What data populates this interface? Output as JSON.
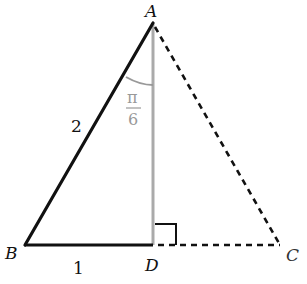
{
  "diagram": {
    "type": "triangle-geometry",
    "points": {
      "A": {
        "label": "A",
        "x": 153,
        "y": 23
      },
      "B": {
        "label": "B",
        "x": 25,
        "y": 245
      },
      "C": {
        "label": "C",
        "x": 280,
        "y": 245
      },
      "D": {
        "label": "D",
        "x": 153,
        "y": 245
      }
    },
    "segments": [
      {
        "from": "A",
        "to": "B",
        "style": "solid",
        "color": "#111111",
        "label": "2"
      },
      {
        "from": "B",
        "to": "D",
        "style": "solid",
        "color": "#111111",
        "label": "1"
      },
      {
        "from": "A",
        "to": "D",
        "style": "solid",
        "color": "#aaaaaa"
      },
      {
        "from": "A",
        "to": "C",
        "style": "dashed",
        "color": "#111111"
      },
      {
        "from": "D",
        "to": "C",
        "style": "dashed",
        "color": "#111111"
      }
    ],
    "angle_mark": {
      "at": "A",
      "between": [
        "B",
        "D"
      ],
      "numerator": "π",
      "denominator": "6",
      "color": "#999999"
    },
    "right_angle_mark": {
      "at": "D"
    },
    "labels": {
      "A": "A",
      "B": "B",
      "C": "C",
      "D": "D",
      "side_AB": "2",
      "side_BD": "1",
      "angle_num": "π",
      "angle_den": "6"
    },
    "colors": {
      "ink": "#111111",
      "gray": "#aaaaaa",
      "angle_gray": "#999999"
    }
  }
}
